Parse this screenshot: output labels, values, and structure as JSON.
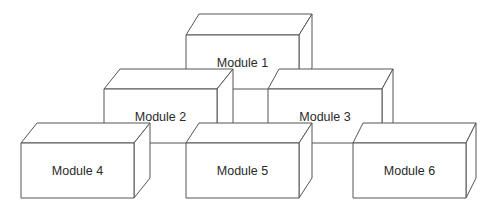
{
  "diagram": {
    "type": "stacked-module-blocks",
    "stroke_color": "#555555",
    "fill_color": "#ffffff",
    "text_color": "#2a2a2a",
    "modules": [
      {
        "id": 1,
        "label": "Module 1",
        "row": "top",
        "front": {
          "x1": 186,
          "y1": 35,
          "x2": 299,
          "y2": 89
        },
        "depth": {
          "dx": 13,
          "dy": -21
        }
      },
      {
        "id": 2,
        "label": "Module 2",
        "row": "middle",
        "front": {
          "x1": 104,
          "y1": 89,
          "x2": 217,
          "y2": 143
        },
        "depth": {
          "dx": 16,
          "dy": -20
        }
      },
      {
        "id": 3,
        "label": "Module 3",
        "row": "middle",
        "front": {
          "x1": 268,
          "y1": 89,
          "x2": 382,
          "y2": 143
        },
        "depth": {
          "dx": 11,
          "dy": -20
        }
      },
      {
        "id": 4,
        "label": "Module 4",
        "row": "bottom",
        "front": {
          "x1": 21,
          "y1": 143,
          "x2": 134,
          "y2": 198
        },
        "depth": {
          "dx": 16,
          "dy": -20
        }
      },
      {
        "id": 5,
        "label": "Module 5",
        "row": "bottom",
        "front": {
          "x1": 186,
          "y1": 143,
          "x2": 299,
          "y2": 198
        },
        "depth": {
          "dx": 13,
          "dy": -20
        }
      },
      {
        "id": 6,
        "label": "Module 6",
        "row": "bottom",
        "front": {
          "x1": 353,
          "y1": 143,
          "x2": 466,
          "y2": 198
        },
        "depth": {
          "dx": 10,
          "dy": -20
        }
      }
    ]
  }
}
